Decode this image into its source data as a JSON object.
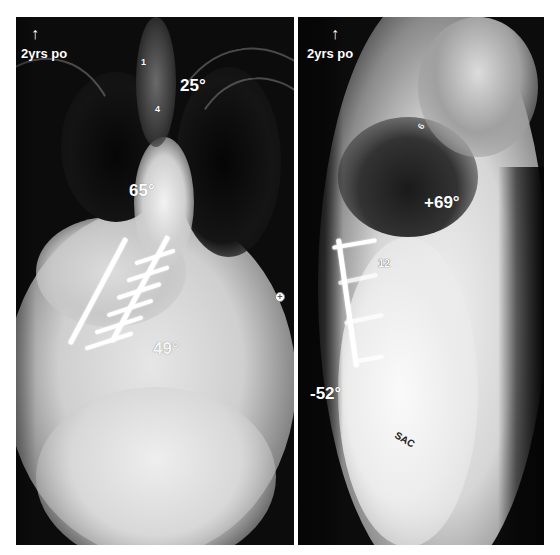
{
  "figure": {
    "background_color": "#ffffff",
    "divider_color": "#ffffff"
  },
  "panels": [
    {
      "id": "ap",
      "view": "AP",
      "time_label": "2yrs po",
      "orientation_arrow": "↑",
      "cobb_angles": [
        {
          "label": "25°",
          "region": "upper thoracic"
        },
        {
          "label": "65°",
          "region": "main thoracic"
        },
        {
          "label": "49°",
          "region": "lumbar"
        }
      ],
      "vertebra_markers": [
        "1",
        "4"
      ],
      "skin_marker": "+"
    },
    {
      "id": "lateral",
      "view": "Lateral",
      "time_label": "2yrs po",
      "orientation_arrow": "↑",
      "sagittal_angles": [
        {
          "label": "+69°",
          "region": "thoracic kyphosis"
        },
        {
          "label": "-52°",
          "region": "lumbar lordosis"
        }
      ],
      "vertebra_markers": [
        "6",
        "12"
      ],
      "sacrum_label": "SAC"
    }
  ],
  "colors": {
    "label_text": "#ffffff",
    "dark_lung": "#0c0c0c",
    "bone_bright": "#e8e8e8",
    "hardware": "#ffffff",
    "sac_text": "#222222"
  }
}
